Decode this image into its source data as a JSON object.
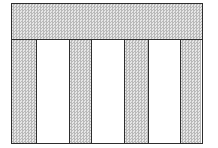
{
  "diagram": {
    "type": "grid-layout",
    "top_band": {
      "fill": "shaded"
    },
    "columns": [
      {
        "index": 1,
        "fill": "shaded",
        "left": 0,
        "width": 24
      },
      {
        "index": 2,
        "fill": "white",
        "left": 24,
        "width": 33
      },
      {
        "index": 3,
        "fill": "shaded",
        "left": 57,
        "width": 22
      },
      {
        "index": 4,
        "fill": "white",
        "left": 79,
        "width": 33
      },
      {
        "index": 5,
        "fill": "shaded",
        "left": 112,
        "width": 24
      },
      {
        "index": 6,
        "fill": "white",
        "left": 136,
        "width": 32
      },
      {
        "index": 7,
        "fill": "shaded",
        "left": 168,
        "width": 24
      }
    ],
    "colors": {
      "border": "#2e2e2e",
      "shade": "#d4d4d4",
      "white": "#ffffff"
    }
  }
}
